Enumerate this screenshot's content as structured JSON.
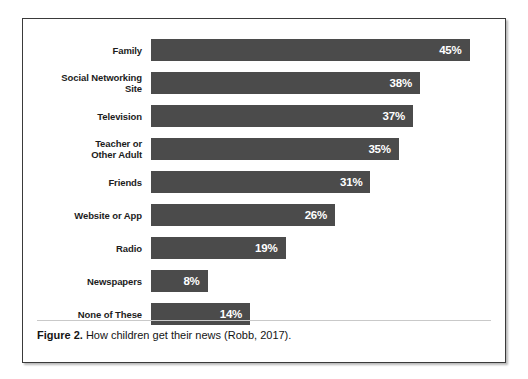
{
  "figure": {
    "caption_label": "Figure 2.",
    "caption_text": " How children get their news (Robb, 2017)."
  },
  "chart_data": {
    "type": "bar",
    "orientation": "horizontal",
    "title": "",
    "subtitle": "",
    "xlabel": "",
    "ylabel": "",
    "xlim": [
      0,
      50
    ],
    "grid": false,
    "legend": null,
    "value_suffix": "%",
    "bar_color": "#4b4b4b",
    "value_label_color": "#ffffff",
    "categories": [
      "Family",
      "Social Networking\nSite",
      "Television",
      "Teacher or\nOther Adult",
      "Friends",
      "Website or App",
      "Radio",
      "Newspapers",
      "None of These"
    ],
    "values": [
      45,
      38,
      37,
      35,
      31,
      26,
      19,
      8,
      14
    ],
    "value_labels": [
      "45%",
      "38%",
      "37%",
      "35%",
      "31%",
      "26%",
      "19%",
      "8%",
      "14%"
    ]
  }
}
